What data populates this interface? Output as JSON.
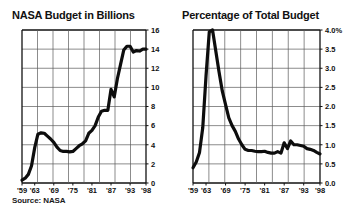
{
  "source_note": "Source: NASA",
  "chart_data": [
    {
      "id": "nasa-budget",
      "type": "line",
      "title": "NASA Budget in Billions",
      "xlabel": "",
      "ylabel": "",
      "grid": true,
      "legend": "none",
      "xlim": [
        1959,
        1998
      ],
      "ylim": [
        0,
        16
      ],
      "ytick_labels": [
        "0",
        "2",
        "4",
        "6",
        "8",
        "10",
        "12",
        "14",
        "16"
      ],
      "ytick_values": [
        0,
        2,
        4,
        6,
        8,
        10,
        12,
        14,
        16
      ],
      "xtick_labels": [
        "'59",
        "'63",
        "'69",
        "'75",
        "'81",
        "'87",
        "'93",
        "'98"
      ],
      "xtick_values": [
        1959,
        1963,
        1969,
        1975,
        1981,
        1987,
        1993,
        1998
      ],
      "x": [
        1959,
        1960,
        1961,
        1962,
        1963,
        1964,
        1965,
        1966,
        1967,
        1968,
        1969,
        1970,
        1971,
        1972,
        1973,
        1974,
        1975,
        1976,
        1977,
        1978,
        1979,
        1980,
        1981,
        1982,
        1983,
        1984,
        1985,
        1986,
        1987,
        1988,
        1989,
        1990,
        1991,
        1992,
        1993,
        1994,
        1995,
        1996,
        1997,
        1998
      ],
      "values": [
        0.3,
        0.5,
        0.9,
        1.8,
        3.7,
        5.1,
        5.25,
        5.2,
        4.9,
        4.6,
        4.25,
        3.75,
        3.4,
        3.3,
        3.3,
        3.25,
        3.3,
        3.6,
        3.9,
        4.1,
        4.4,
        5.2,
        5.5,
        6.0,
        6.9,
        7.5,
        7.6,
        7.6,
        9.8,
        9.0,
        10.9,
        12.4,
        13.9,
        14.3,
        14.3,
        13.7,
        13.85,
        13.8,
        14.0,
        14.0
      ],
      "annotations": [
        "Steep rise through Apollo era peaking mid-1960s",
        "Decline through early 1970s",
        "Sustained growth through 1980s to about 14 billion"
      ]
    },
    {
      "id": "percentage-of-total-budget",
      "type": "line",
      "title": "Percentage of Total Budget",
      "xlabel": "",
      "ylabel": "",
      "grid": true,
      "legend": "none",
      "xlim": [
        1959,
        1998
      ],
      "ylim": [
        0,
        4
      ],
      "ytick_labels": [
        "0.0",
        "0.5",
        "1.0",
        "1.5",
        "2.0",
        "2.5",
        "3.0",
        "3.5",
        "4.0%"
      ],
      "ytick_values": [
        0,
        0.5,
        1.0,
        1.5,
        2.0,
        2.5,
        3.0,
        3.5,
        4.0
      ],
      "xtick_labels": [
        "'59",
        "'63",
        "'69",
        "'75",
        "'81",
        "'87",
        "'93",
        "'98"
      ],
      "xtick_values": [
        1959,
        1963,
        1969,
        1975,
        1981,
        1987,
        1993,
        1998
      ],
      "x": [
        1959,
        1960,
        1961,
        1962,
        1963,
        1964,
        1965,
        1966,
        1967,
        1968,
        1969,
        1970,
        1971,
        1972,
        1973,
        1974,
        1975,
        1976,
        1977,
        1978,
        1979,
        1980,
        1981,
        1982,
        1983,
        1984,
        1985,
        1986,
        1987,
        1988,
        1989,
        1990,
        1991,
        1992,
        1993,
        1994,
        1995,
        1996,
        1997,
        1998
      ],
      "values": [
        0.4,
        0.55,
        0.8,
        1.45,
        2.8,
        3.95,
        4.0,
        3.45,
        2.9,
        2.4,
        2.05,
        1.7,
        1.5,
        1.35,
        1.15,
        1.0,
        0.88,
        0.85,
        0.85,
        0.83,
        0.82,
        0.82,
        0.83,
        0.8,
        0.78,
        0.78,
        0.82,
        0.78,
        1.05,
        0.9,
        1.1,
        1.0,
        1.0,
        0.98,
        0.96,
        0.9,
        0.88,
        0.85,
        0.8,
        0.76
      ],
      "annotations": [
        "Sharp spike to 4.0 percent in mid 1960s",
        "Rapid fall to under one percent by mid 1970s",
        "Flat near 0.8 to 1.0 percent thereafter"
      ]
    }
  ]
}
